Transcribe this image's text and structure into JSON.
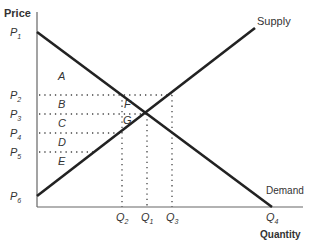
{
  "diagram": {
    "y_axis_label": "Price",
    "x_axis_label": "Quantity",
    "curves": {
      "supply": {
        "label": "Supply",
        "x1": 37,
        "y1": 196,
        "x2": 255,
        "y2": 28
      },
      "demand": {
        "label": "Demand",
        "x1": 37,
        "y1": 32,
        "x2": 272,
        "y2": 207
      }
    },
    "price_labels": [
      {
        "main": "P",
        "sub": "1",
        "y": 32
      },
      {
        "main": "P",
        "sub": "2",
        "y": 95
      },
      {
        "main": "P",
        "sub": "3",
        "y": 114
      },
      {
        "main": "P",
        "sub": "4",
        "y": 133
      },
      {
        "main": "P",
        "sub": "5",
        "y": 152
      },
      {
        "main": "P",
        "sub": "6",
        "y": 196
      }
    ],
    "quantity_labels": [
      {
        "main": "Q",
        "sub": "2",
        "x": 122
      },
      {
        "main": "Q",
        "sub": "1",
        "x": 147
      },
      {
        "main": "Q",
        "sub": "3",
        "x": 172
      },
      {
        "main": "Q",
        "sub": "4",
        "x": 272
      }
    ],
    "area_labels": [
      {
        "text": "A",
        "x": 60,
        "y": 79
      },
      {
        "text": "B",
        "x": 60,
        "y": 107
      },
      {
        "text": "C",
        "x": 60,
        "y": 126
      },
      {
        "text": "D",
        "x": 60,
        "y": 145
      },
      {
        "text": "E",
        "x": 60,
        "y": 164
      },
      {
        "text": "F",
        "x": 125,
        "y": 107
      },
      {
        "text": "G",
        "x": 125,
        "y": 123
      }
    ],
    "colors": {
      "curve": "#222222",
      "axis": "#555555",
      "dotted": "#444444",
      "text": "#333333"
    }
  }
}
